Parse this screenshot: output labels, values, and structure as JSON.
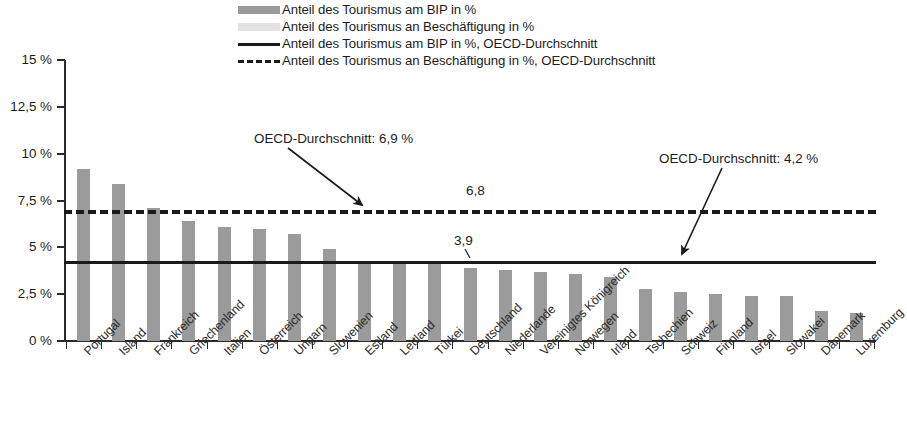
{
  "legend": {
    "items": [
      {
        "label": "Anteil des Tourismus am BIP in %",
        "key": "swatch",
        "color": "#9b9b9b"
      },
      {
        "label": "Anteil des Tourismus an Beschäftigung in %",
        "key": "swatch",
        "color": "#e2e2e2"
      },
      {
        "label": "Anteil des Tourismus am BIP in %, OECD-Durchschnitt",
        "key": "line-solid",
        "color": "#1a1a1a"
      },
      {
        "label": "Anteil des Tourismus an Beschäftigung in %, OECD-Durchschnitt",
        "key": "line-dashed",
        "color": "#1a1a1a"
      }
    ]
  },
  "annotations": [
    {
      "text": "OECD-Durchschnitt: 6,9 %",
      "x": 254,
      "y": 132
    },
    {
      "text": "OECD-Durchschnitt: 4,2 %",
      "x": 659,
      "y": 152
    }
  ],
  "value_labels": [
    {
      "text": "6,8",
      "x": 466,
      "y": 186
    },
    {
      "text": "3,9",
      "x": 454,
      "y": 236
    }
  ],
  "chart_data": {
    "type": "bar",
    "title": "",
    "subtitle": "",
    "xlabel": "",
    "ylabel": "",
    "ylim": [
      0,
      15
    ],
    "grid": false,
    "legend_position": "top",
    "ytick_labels": [
      "0 %",
      "2,5 %",
      "5 %",
      "7,5 %",
      "10 %",
      "12,5 %",
      "15 %"
    ],
    "ytick_values": [
      0,
      2.5,
      5,
      7.5,
      10,
      12.5,
      15
    ],
    "categories": [
      "Portugal",
      "Island",
      "Frankreich",
      "Griechenland",
      "Italien",
      "Österreich",
      "Ungarn",
      "Slowenien",
      "Estland",
      "Lettland",
      "Türkei",
      "Deutschland",
      "Niederlande",
      "Vereinigtes Königreich",
      "Norwegen",
      "Irland",
      "Tschechien",
      "Schweiz",
      "Finnland",
      "Israel",
      "Slowakei",
      "Dänemark",
      "Luxemburg"
    ],
    "series": [
      {
        "name": "Anteil des Tourismus am BIP in %",
        "color": "#9b9b9b",
        "values": [
          9.2,
          8.4,
          7.1,
          6.4,
          6.1,
          6.0,
          5.7,
          4.9,
          4.1,
          4.1,
          4.1,
          3.9,
          3.8,
          3.7,
          3.6,
          3.4,
          2.8,
          2.6,
          2.5,
          2.4,
          2.4,
          1.6,
          1.5
        ]
      }
    ],
    "reference_lines": [
      {
        "name": "Anteil des Tourismus am BIP in %, OECD-Durchschnitt",
        "value": 4.2,
        "style": "solid",
        "color": "#1a1a1a"
      },
      {
        "name": "Anteil des Tourismus an Beschäftigung in %, OECD-Durchschnitt",
        "value": 6.9,
        "style": "dashed",
        "color": "#1a1a1a"
      }
    ],
    "highlighted_category": "Deutschland",
    "highlighted_values": {
      "beschaeftigung": 6.8,
      "bip": 3.9
    }
  }
}
